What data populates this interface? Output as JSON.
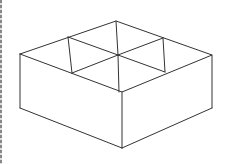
{
  "diagram": {
    "stroke_color": "#333333",
    "background": "#ffffff",
    "vertices": {
      "top_left": [
        20,
        54
      ],
      "top_back": [
        116,
        21
      ],
      "top_right": [
        212,
        55
      ],
      "top_front": [
        122,
        92
      ],
      "bottom_left": [
        20,
        108
      ],
      "bottom_front": [
        122,
        148
      ],
      "bottom_right": [
        212,
        108
      ],
      "divider_left_top": [
        68,
        37
      ],
      "divider_left_bottom": [
        72,
        73
      ],
      "divider_right_top": [
        163,
        38
      ],
      "divider_right_bottom": [
        165,
        72
      ],
      "center_top": [
        118,
        55
      ],
      "center_bottom": [
        119,
        92
      ]
    }
  }
}
